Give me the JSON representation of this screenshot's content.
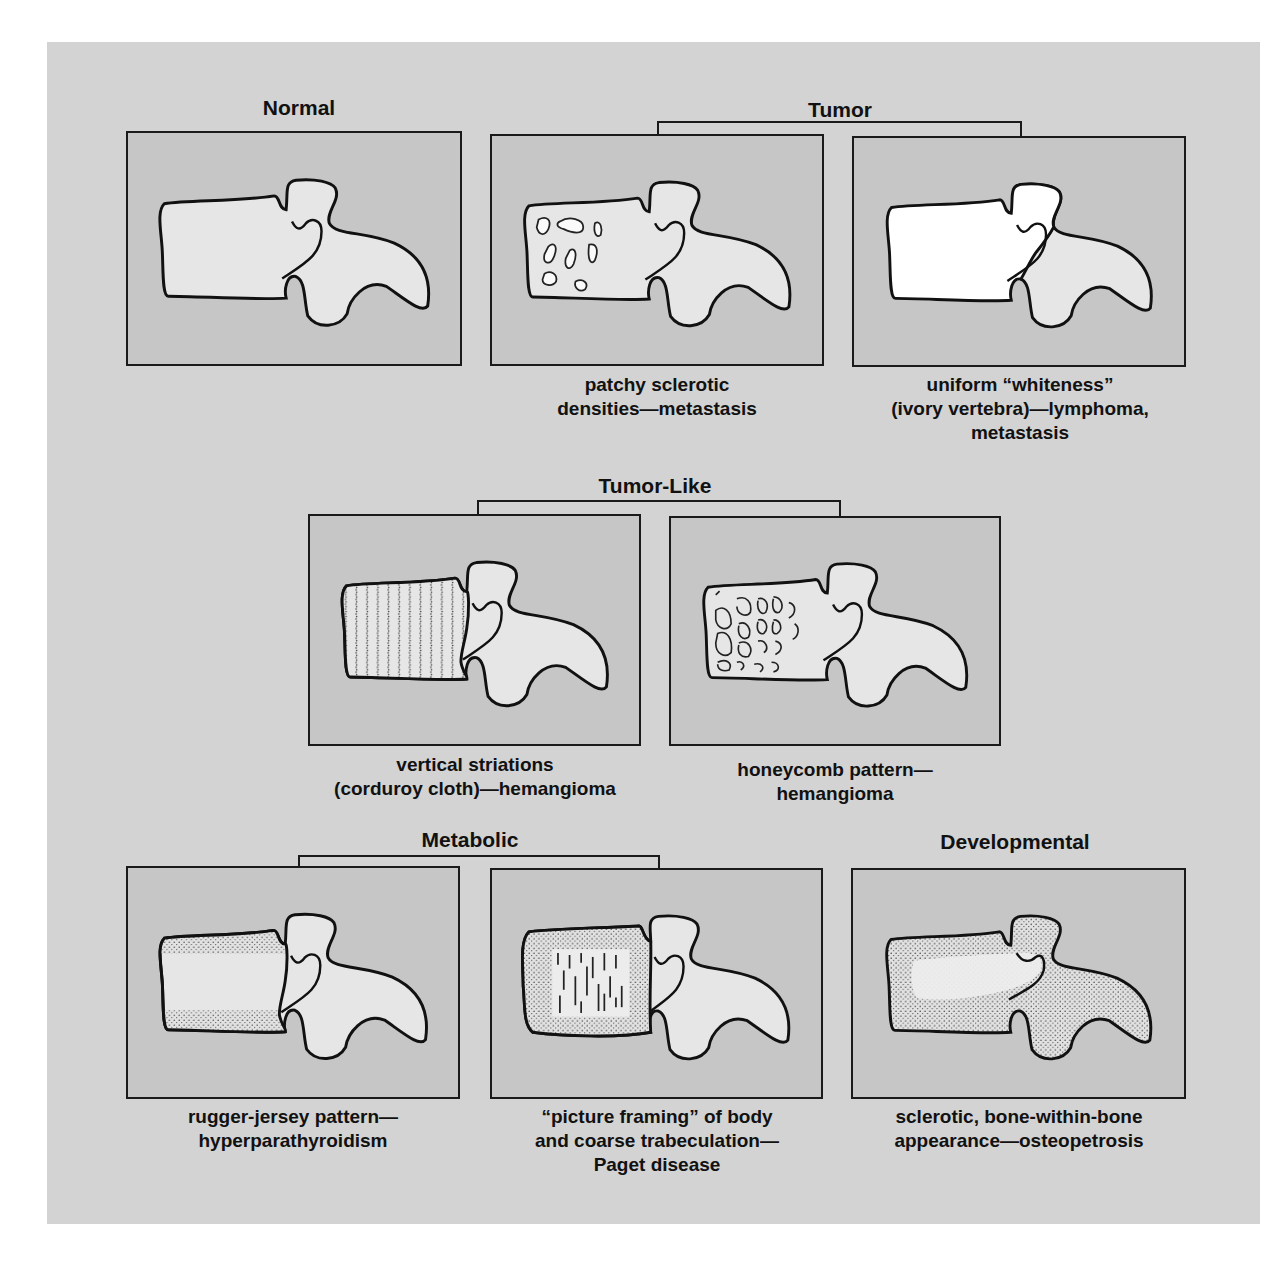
{
  "figure": {
    "groups": [
      {
        "id": "normal",
        "title": "Normal"
      },
      {
        "id": "tumor",
        "title": "Tumor"
      },
      {
        "id": "tumor_like",
        "title": "Tumor-Like"
      },
      {
        "id": "metabolic",
        "title": "Metabolic"
      },
      {
        "id": "developmental",
        "title": "Developmental"
      }
    ],
    "panels": [
      {
        "id": "normal",
        "group": "Normal",
        "pattern": "normal",
        "caption": ""
      },
      {
        "id": "patchy",
        "group": "Tumor",
        "pattern": "patchy-sclerotic",
        "caption": "patchy sclerotic\ndensities—metastasis"
      },
      {
        "id": "ivory",
        "group": "Tumor",
        "pattern": "uniform-white",
        "caption": "uniform “whiteness”\n(ivory vertebra)—lymphoma,\nmetastasis"
      },
      {
        "id": "corduroy",
        "group": "Tumor-Like",
        "pattern": "vertical-striations",
        "caption": "vertical striations\n(corduroy cloth)—hemangioma"
      },
      {
        "id": "honeycomb",
        "group": "Tumor-Like",
        "pattern": "honeycomb",
        "caption": "honeycomb pattern—\nhemangioma"
      },
      {
        "id": "rugger",
        "group": "Metabolic",
        "pattern": "rugger-jersey",
        "caption": "rugger-jersey pattern—\nhyperparathyroidism"
      },
      {
        "id": "paget",
        "group": "Metabolic",
        "pattern": "picture-framing",
        "caption": "“picture framing” of body\nand coarse trabeculation—\nPaget disease"
      },
      {
        "id": "osteopetrosis",
        "group": "Developmental",
        "pattern": "bone-within-bone",
        "caption": "sclerotic, bone-within-bone\nappearance—osteopetrosis"
      }
    ],
    "colors": {
      "panel_bg": "#d3d3d3",
      "box_bg": "#c6c6c6",
      "bone_fill": "#e6e6e6",
      "ivory_fill": "#ffffff",
      "outline": "#1a1a1a"
    }
  }
}
